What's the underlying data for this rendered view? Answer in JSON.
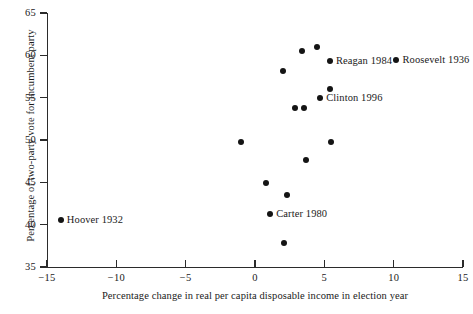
{
  "chart_data": {
    "type": "scatter",
    "title": "",
    "xlabel": "Percentage change in real per capita disposable income in election year",
    "ylabel": "Percentage of two-party vote for incumbent party",
    "xlim": [
      -15,
      15
    ],
    "ylim": [
      35,
      65
    ],
    "xticks": [
      -15,
      -10,
      -5,
      0,
      5,
      10,
      15
    ],
    "yticks": [
      35,
      40,
      45,
      50,
      55,
      60,
      65
    ],
    "xticklabels": [
      "−15",
      "−10",
      "−5",
      "0",
      "5",
      "10",
      "15"
    ],
    "yticklabels": [
      "35",
      "40",
      "45",
      "50",
      "55",
      "60",
      "65"
    ],
    "grid": false,
    "legend": false,
    "points": [
      {
        "x": -14.0,
        "y": 40.5,
        "label": "Hoover 1932",
        "label_side": "right"
      },
      {
        "x": -1.0,
        "y": 49.8,
        "label": "",
        "label_side": "right"
      },
      {
        "x": 0.8,
        "y": 44.9,
        "label": "",
        "label_side": "right"
      },
      {
        "x": 1.1,
        "y": 41.3,
        "label": "Carter 1980",
        "label_side": "right"
      },
      {
        "x": 2.0,
        "y": 58.2,
        "label": "",
        "label_side": "right"
      },
      {
        "x": 2.1,
        "y": 37.8,
        "label": "",
        "label_side": "right"
      },
      {
        "x": 2.3,
        "y": 43.5,
        "label": "",
        "label_side": "right"
      },
      {
        "x": 2.9,
        "y": 53.8,
        "label": "",
        "label_side": "right"
      },
      {
        "x": 3.4,
        "y": 60.5,
        "label": "",
        "label_side": "right"
      },
      {
        "x": 3.5,
        "y": 53.8,
        "label": "",
        "label_side": "right"
      },
      {
        "x": 3.7,
        "y": 47.6,
        "label": "",
        "label_side": "right"
      },
      {
        "x": 4.5,
        "y": 61.0,
        "label": "",
        "label_side": "right"
      },
      {
        "x": 4.7,
        "y": 55.0,
        "label": "Clinton 1996",
        "label_side": "right"
      },
      {
        "x": 5.4,
        "y": 56.0,
        "label": "",
        "label_side": "right"
      },
      {
        "x": 5.4,
        "y": 59.3,
        "label": "Reagan 1984",
        "label_side": "right"
      },
      {
        "x": 5.5,
        "y": 49.8,
        "label": "",
        "label_side": "right"
      },
      {
        "x": 10.2,
        "y": 59.4,
        "label": "Roosevelt 1936",
        "label_side": "right"
      }
    ]
  }
}
